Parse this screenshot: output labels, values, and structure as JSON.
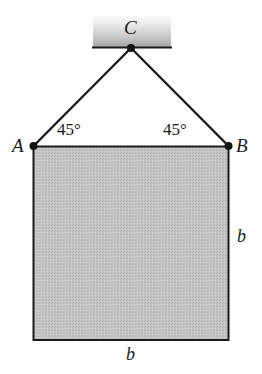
{
  "figure": {
    "background_color": "#ffffff"
  },
  "support": {
    "name": "ceiling-support-block",
    "gradient_top_color": "#f2f2f2",
    "gradient_bottom_color": "#a8a8a8",
    "baseline_color": "#1a1a1a"
  },
  "block": {
    "name": "square-block",
    "fill_color": "#c0c0c0",
    "stroke_color": "#1a1a1a"
  },
  "cables": {
    "stroke_color": "#1a1a1a"
  },
  "labels": {
    "point_c": "C",
    "point_a": "A",
    "point_b": "B",
    "angle_left": "45°",
    "angle_right": "45°",
    "side_right": "b",
    "side_bottom": "b"
  }
}
